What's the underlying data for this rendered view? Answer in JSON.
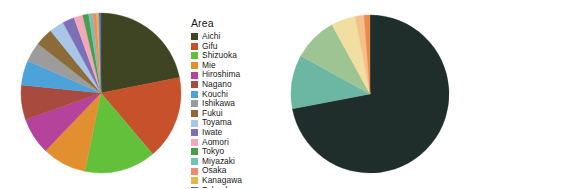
{
  "figure": {
    "background": "#ffffff",
    "panels": [
      "area-pie",
      "region-pie"
    ]
  },
  "chart_data": [
    {
      "type": "pie",
      "title": "",
      "legend_title": "Area",
      "legend_position": "right",
      "start_angle_deg": 90,
      "direction": "clockwise",
      "categories": [
        "Aichi",
        "Gifu",
        "Shizuoka",
        "Mie",
        "Hiroshima",
        "Nagano",
        "Kouchi",
        "Ishikawa",
        "Fukui",
        "Toyama",
        "Iwate",
        "Aomori",
        "Tokyo",
        "Miyazaki",
        "Osaka",
        "Kanagawa",
        "Fukuoka"
      ],
      "values": [
        22.0,
        17.0,
        14.5,
        9.0,
        7.5,
        7.0,
        5.0,
        4.0,
        3.6,
        3.0,
        2.4,
        1.8,
        1.2,
        0.8,
        0.8,
        0.5,
        0.4
      ],
      "colors": [
        "#3f4423",
        "#c6512b",
        "#63c03a",
        "#e2902f",
        "#b5439b",
        "#a84b3e",
        "#4ca3d9",
        "#9c9c9c",
        "#8d6b38",
        "#a8c7e6",
        "#7b6fb5",
        "#f5a8bc",
        "#4a9e4a",
        "#6fc4b5",
        "#f08a6a",
        "#ddb84a",
        "#5271c4"
      ],
      "xlabel": "",
      "ylabel": ""
    },
    {
      "type": "pie",
      "title": "",
      "legend_title": "Region",
      "legend_position": "right",
      "start_angle_deg": 90,
      "direction": "clockwise",
      "categories": [
        "Chubu",
        "Chugoku/Shikoku",
        "Kinki",
        "Tohoku",
        "Kanto",
        "Kyushu"
      ],
      "values": [
        72.0,
        11.0,
        9.0,
        5.0,
        1.8,
        1.2
      ],
      "colors": [
        "#1f2d2b",
        "#6cb6a4",
        "#9dc492",
        "#f0dfa0",
        "#f5c08a",
        "#ea8b4e"
      ],
      "xlabel": "",
      "ylabel": ""
    }
  ],
  "legends": {
    "area": {
      "title": "Area",
      "items": [
        {
          "label": "Aichi",
          "color": "#3f4423"
        },
        {
          "label": "Gifu",
          "color": "#c6512b"
        },
        {
          "label": "Shizuoka",
          "color": "#63c03a"
        },
        {
          "label": "Mie",
          "color": "#e2902f"
        },
        {
          "label": "Hiroshima",
          "color": "#b5439b"
        },
        {
          "label": "Nagano",
          "color": "#a84b3e"
        },
        {
          "label": "Kouchi",
          "color": "#4ca3d9"
        },
        {
          "label": "Ishikawa",
          "color": "#9c9c9c"
        },
        {
          "label": "Fukui",
          "color": "#8d6b38"
        },
        {
          "label": "Toyama",
          "color": "#a8c7e6"
        },
        {
          "label": "Iwate",
          "color": "#7b6fb5"
        },
        {
          "label": "Aomori",
          "color": "#f5a8bc"
        },
        {
          "label": "Tokyo",
          "color": "#4a9e4a"
        },
        {
          "label": "Miyazaki",
          "color": "#6fc4b5"
        },
        {
          "label": "Osaka",
          "color": "#f08a6a"
        },
        {
          "label": "Kanagawa",
          "color": "#ddb84a"
        },
        {
          "label": "Fukuoka",
          "color": "#5271c4"
        }
      ]
    },
    "region": {
      "title": "Region",
      "items": [
        {
          "label": "Chubu",
          "color": "#1f2d2b"
        },
        {
          "label": "Chugoku/Shikoku",
          "color": "#6cb6a4"
        },
        {
          "label": "Kinki",
          "color": "#9dc492"
        },
        {
          "label": "Tohoku",
          "color": "#f0dfa0"
        },
        {
          "label": "Kanto",
          "color": "#f5c08a"
        },
        {
          "label": "Kyushu",
          "color": "#ea8b4e"
        }
      ]
    }
  }
}
